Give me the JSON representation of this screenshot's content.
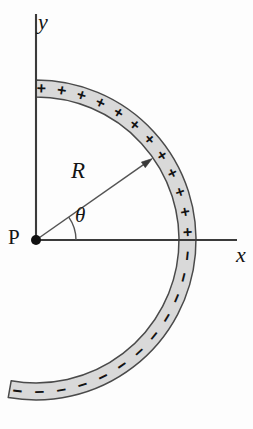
{
  "figure": {
    "kind": "physics-diagram",
    "background_color": "#fdfdfd",
    "band_fill_color": "#d9d9d9",
    "band_stroke_color": "#4a4a4a",
    "axis_color": "#3b3b3b",
    "ink_color": "#121212"
  },
  "labels": {
    "y_axis": "y",
    "x_axis": "x",
    "point": "P",
    "radius": "R",
    "angle": "θ"
  },
  "geometry": {
    "origin": {
      "x": 36,
      "y": 240
    },
    "inner_radius": 143,
    "outer_radius": 160,
    "arc_start_angle_deg": 90,
    "arc_end_angle_deg": -100,
    "radius_vector_angle_deg": 35,
    "angle_arc_radius": 40,
    "y_axis_top": 14,
    "y_axis_bottom": 240,
    "x_axis_left": 36,
    "x_axis_right": 237
  },
  "charges": {
    "positive_symbol": "+",
    "positive_count": 12,
    "positive_arc_from_deg": 88,
    "positive_arc_to_deg": 3,
    "negative_symbol": "−",
    "negative_count": 12,
    "negative_arc_from_deg": -6,
    "negative_arc_to_deg": -97
  }
}
